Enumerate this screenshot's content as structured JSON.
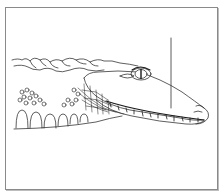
{
  "figure": {
    "style": "black ink line drawing on white",
    "has_leader_line": true,
    "leader_line_label": "",
    "colors": {
      "ink": "#1a1a1a",
      "frame": "#8a8a8a",
      "background": "#ffffff"
    },
    "caption": ""
  }
}
